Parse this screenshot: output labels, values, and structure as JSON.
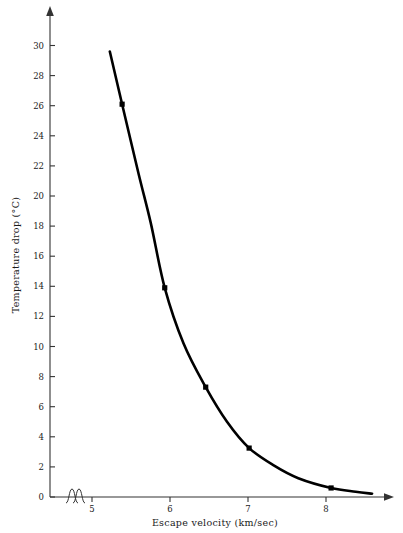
{
  "chart_data": {
    "type": "line",
    "title": "",
    "xlabel": "Escape velocity (km/sec)",
    "ylabel": "Temperature drop (°C)",
    "xlim": [
      4.62,
      8.72
    ],
    "ylim": [
      0,
      31
    ],
    "xticks": [
      5,
      6,
      7,
      8
    ],
    "xtick_labels": [
      "5",
      "6",
      "7",
      "8"
    ],
    "yticks": [
      0,
      2,
      4,
      6,
      8,
      10,
      12,
      14,
      16,
      18,
      20,
      22,
      24,
      26,
      28,
      30
    ],
    "ytick_labels": [
      "0",
      "2",
      "4",
      "6",
      "8",
      "10",
      "12",
      "14",
      "16",
      "18",
      "20",
      "22",
      "24",
      "26",
      "28",
      "30"
    ],
    "grid": false,
    "legend": false,
    "axis_break": {
      "axis": "x",
      "symbol": "double-squiggle",
      "position": 4.78
    },
    "axis_arrows": [
      "x-right",
      "y-top"
    ],
    "series": [
      {
        "name": "Temperature drop vs escape velocity",
        "color": "#000000",
        "marker": "square",
        "x": [
          5.5,
          6.02,
          6.52,
          7.05,
          8.05
        ],
        "values": [
          26.1,
          13.9,
          7.3,
          3.25,
          0.6
        ]
      }
    ],
    "curve_points": {
      "x": [
        5.35,
        5.5,
        5.7,
        5.85,
        6.02,
        6.25,
        6.52,
        6.78,
        7.05,
        7.35,
        7.65,
        8.05,
        8.35,
        8.55
      ],
      "y": [
        29.6,
        26.1,
        21.5,
        18.2,
        13.9,
        10.2,
        7.3,
        5.0,
        3.25,
        2.1,
        1.25,
        0.6,
        0.35,
        0.22
      ]
    },
    "annotations": []
  },
  "axis_labels": {
    "x_title": "Escape velocity (km/sec)",
    "y_title": "Temperature drop (°C)"
  }
}
